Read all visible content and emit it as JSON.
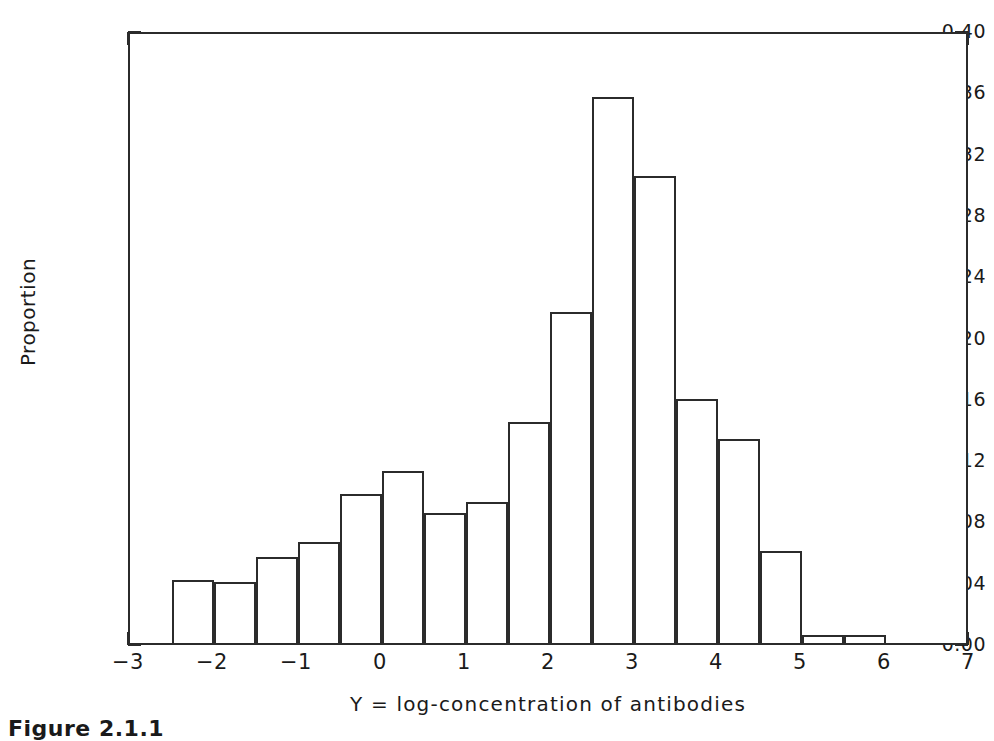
{
  "chart_data": {
    "type": "bar",
    "title": "",
    "subtitle": "",
    "xlabel": "Y = log-concentration of antibodies",
    "ylabel": "Proportion",
    "xlim": [
      -3,
      7
    ],
    "ylim": [
      0.0,
      0.4
    ],
    "bin_width": 0.5,
    "grid": false,
    "legend": null,
    "x_tick_labels": [
      "-3",
      "-2",
      "-1",
      "0",
      "1",
      "2",
      "3",
      "4",
      "5",
      "6",
      "7"
    ],
    "x_tick_values": [
      -3,
      -2,
      -1,
      0,
      1,
      2,
      3,
      4,
      5,
      6,
      7
    ],
    "x_minor_step": 0.5,
    "y_tick_labels": [
      "0.40",
      "0.36",
      "0.32",
      "0.28",
      "0.24",
      "0.20",
      "0.16",
      "0.12",
      "0.08",
      "0.04",
      "0.00"
    ],
    "y_tick_values": [
      0.4,
      0.36,
      0.32,
      0.28,
      0.24,
      0.2,
      0.16,
      0.12,
      0.08,
      0.04,
      0.0
    ],
    "y_minor_step": 0.02,
    "bins": [
      {
        "left": -2.5,
        "right": -2.0,
        "value": 0.041
      },
      {
        "left": -2.0,
        "right": -1.5,
        "value": 0.04
      },
      {
        "left": -1.5,
        "right": -1.0,
        "value": 0.056
      },
      {
        "left": -1.0,
        "right": -0.5,
        "value": 0.066
      },
      {
        "left": -0.5,
        "right": 0.0,
        "value": 0.097
      },
      {
        "left": 0.0,
        "right": 0.5,
        "value": 0.112
      },
      {
        "left": 0.5,
        "right": 1.0,
        "value": 0.085
      },
      {
        "left": 1.0,
        "right": 1.5,
        "value": 0.092
      },
      {
        "left": 1.5,
        "right": 2.0,
        "value": 0.144
      },
      {
        "left": 2.0,
        "right": 2.5,
        "value": 0.216
      },
      {
        "left": 2.5,
        "right": 3.0,
        "value": 0.356
      },
      {
        "left": 3.0,
        "right": 3.5,
        "value": 0.305
      },
      {
        "left": 3.5,
        "right": 4.0,
        "value": 0.159
      },
      {
        "left": 4.0,
        "right": 4.5,
        "value": 0.133
      },
      {
        "left": 4.5,
        "right": 5.0,
        "value": 0.06
      },
      {
        "left": 5.0,
        "right": 5.5,
        "value": 0.005
      },
      {
        "left": 5.5,
        "right": 6.0,
        "value": 0.005
      }
    ],
    "categories": [
      "-2.5",
      "-2.0",
      "-1.5",
      "-1.0",
      "-0.5",
      "0.0",
      "0.5",
      "1.0",
      "1.5",
      "2.0",
      "2.5",
      "3.0",
      "3.5",
      "4.0",
      "4.5",
      "5.0",
      "5.5"
    ],
    "values": [
      0.041,
      0.04,
      0.056,
      0.066,
      0.097,
      0.112,
      0.085,
      0.092,
      0.144,
      0.216,
      0.356,
      0.305,
      0.159,
      0.133,
      0.06,
      0.005,
      0.005
    ]
  },
  "caption": {
    "text": "Figure 2.1.1"
  },
  "style": {
    "line_color": "#2b2b2b",
    "text_color": "#1a1a1a",
    "background": "#ffffff"
  }
}
